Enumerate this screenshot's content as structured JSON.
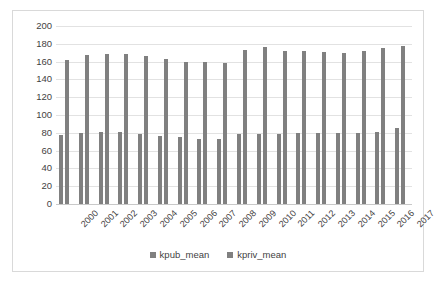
{
  "chart_data": {
    "type": "bar",
    "title": "",
    "xlabel": "",
    "ylabel": "",
    "ylim": [
      0,
      200
    ],
    "ytick_step": 20,
    "yticks": [
      200,
      180,
      160,
      140,
      120,
      100,
      80,
      60,
      40,
      20,
      0
    ],
    "grid": true,
    "legend_position": "bottom",
    "bar_color": "#808080",
    "categories": [
      "2000",
      "2001",
      "2002",
      "2003",
      "2004",
      "2005",
      "2006",
      "2007",
      "2008",
      "2009",
      "2010",
      "2011",
      "2012",
      "2013",
      "2014",
      "2015",
      "2016",
      "2017"
    ],
    "series": [
      {
        "name": "kpub_mean",
        "values": [
          78,
          80,
          81,
          81,
          79,
          76,
          75,
          73,
          73,
          79,
          79,
          79,
          80,
          80,
          80,
          80,
          81,
          85
        ]
      },
      {
        "name": "kpriv_mean",
        "values": [
          162,
          167,
          169,
          169,
          166,
          163,
          160,
          160,
          159,
          173,
          176,
          172,
          172,
          171,
          170,
          172,
          175,
          177
        ]
      }
    ]
  },
  "legend": {
    "items": [
      {
        "label": "kpub_mean",
        "color": "#808080"
      },
      {
        "label": "kpriv_mean",
        "color": "#808080"
      }
    ]
  }
}
